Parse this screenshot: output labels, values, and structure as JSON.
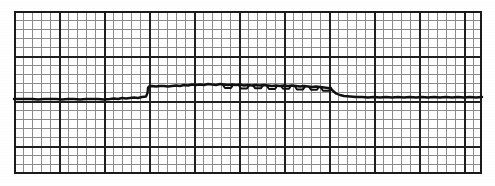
{
  "document": {
    "kind": "strip-chart-recording",
    "title": "ECG Strip Grid Recording",
    "media": "graph paper chart strip"
  },
  "colors": {
    "background": "#ffffff",
    "minor_grid": "#8c8c8c",
    "major_grid": "#1f1f1f",
    "trace": "#101010",
    "border": "#1a1a1a"
  },
  "paper": {
    "left": 14,
    "top": 11,
    "right": 482,
    "bottom": 174,
    "width": 468,
    "height": 163,
    "minor_cell_px": 9.0,
    "major_every_n_cells": 5,
    "major_cell_px": 45.0
  },
  "chart_data": {
    "type": "line",
    "subtitle": "Flat baseline with step elevation and low-amplitude noise",
    "xlabel": "",
    "ylabel": "",
    "xlim": [
      14,
      482
    ],
    "ylim": [
      11,
      174
    ],
    "grid": true,
    "grid_minor_spacing": 9.0,
    "grid_major_spacing": 45.0,
    "legend": "none",
    "baseline_y": 99,
    "elevated_y": 86,
    "step_x_start": 148,
    "step_x_end": 331,
    "annotations": [],
    "series": [
      {
        "name": "channel-1",
        "stroke": "#101010",
        "width": 2.4,
        "x": [
          14,
          20,
          26,
          32,
          38,
          44,
          50,
          56,
          62,
          68,
          74,
          80,
          86,
          92,
          98,
          104,
          110,
          114,
          118,
          122,
          126,
          130,
          134,
          138,
          142,
          146,
          147.5,
          148,
          149,
          152,
          156,
          160,
          164,
          168,
          172,
          176,
          180,
          184,
          188,
          192,
          196,
          200,
          204,
          208,
          212,
          216,
          220,
          224,
          228,
          232,
          236,
          240,
          244,
          248,
          252,
          256,
          260,
          264,
          268,
          272,
          276,
          280,
          284,
          288,
          292,
          296,
          300,
          304,
          308,
          312,
          316,
          320,
          324,
          328,
          331,
          332,
          336,
          340,
          344,
          350,
          356,
          362,
          368,
          374,
          380,
          386,
          392,
          398,
          404,
          410,
          416,
          422,
          428,
          434,
          440,
          446,
          452,
          458,
          464,
          470,
          476,
          482
        ],
        "y": [
          99,
          99,
          99,
          99,
          99.5,
          99,
          99,
          99,
          99.5,
          99,
          99,
          99.5,
          99,
          99,
          99,
          99.5,
          99,
          98.5,
          99,
          98,
          98.5,
          98,
          97.5,
          98,
          97,
          96.5,
          93,
          88,
          86.5,
          86,
          86.5,
          86,
          86,
          86.5,
          86,
          85.5,
          86,
          85,
          85.5,
          84.5,
          85,
          84.5,
          85,
          84,
          84.5,
          85,
          84,
          84.5,
          85,
          84.5,
          85,
          84.5,
          85.5,
          85,
          85.5,
          85,
          85.5,
          85,
          85.5,
          86,
          85.5,
          86,
          85.5,
          86,
          85.5,
          86,
          86.5,
          86,
          86.5,
          87,
          86.5,
          87,
          87.5,
          88,
          88.5,
          90,
          93.5,
          95,
          96,
          96.5,
          97,
          97,
          97.5,
          97,
          97.5,
          97,
          97.5,
          97,
          97.5,
          97,
          97.5,
          97,
          97.5,
          97,
          97.5,
          97,
          97.5,
          97,
          97.5,
          97,
          97.5,
          97
        ],
        "description": "Thick baseline trace, steps up approximately 13 px at x=148 and returns near baseline after x=331"
      },
      {
        "name": "channel-1-noise-bumps",
        "stroke": "#101010",
        "width": 2.0,
        "bump_xs": [
          228,
          244,
          258,
          272,
          286,
          300,
          314,
          326
        ],
        "bump_depth_px": 3,
        "description": "Small periodic downward notches riding on the elevated segment"
      }
    ]
  },
  "elements": {
    "strip_name": "chart-strip",
    "grid_name": "grid-paper",
    "trace_name": "waveform-trace"
  }
}
